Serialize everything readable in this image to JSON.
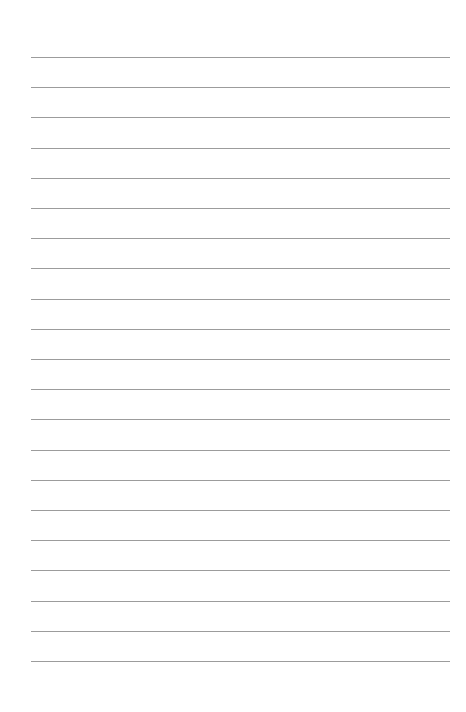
{
  "page": {
    "type": "lined-paper",
    "background_color": "#ffffff",
    "rule_color": "#9c9c9c",
    "rule_count": 21,
    "rule_left": 31,
    "rule_right": 450,
    "first_rule_y": 57,
    "rule_spacing": 30.2
  }
}
